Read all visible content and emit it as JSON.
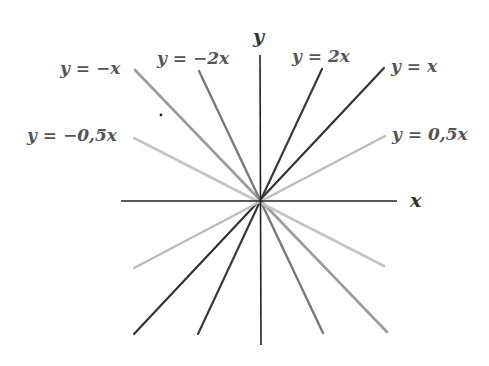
{
  "diagram": {
    "title": "",
    "origin_px": [
      260,
      201
    ],
    "axes": {
      "x_label": "x",
      "y_label": "y",
      "color": "#222222",
      "x_axis_px": [
        [
          121,
          201
        ],
        [
          397,
          201
        ]
      ],
      "y_axis_px": [
        [
          260,
          55
        ],
        [
          261,
          345
        ]
      ]
    },
    "lines": [
      {
        "id": "y_eq_x",
        "label": "y = x",
        "slope": 1,
        "color": "#333333",
        "width": 2.2,
        "p1": [
          134,
          334
        ],
        "p2": [
          384,
          68
        ],
        "label_pos": [
          391,
          72
        ]
      },
      {
        "id": "y_eq_2x",
        "label": "y = 2x",
        "slope": 2,
        "color": "#3a3a3a",
        "width": 2.2,
        "p1": [
          198,
          334
        ],
        "p2": [
          322,
          69
        ],
        "label_pos": [
          292,
          62
        ]
      },
      {
        "id": "y_eq_0_5x",
        "label": "y = 0,5x",
        "slope": 0.5,
        "color": "#bdbdbd",
        "width": 2.4,
        "p1": [
          134,
          268
        ],
        "p2": [
          385,
          136
        ],
        "label_pos": [
          392,
          140
        ]
      },
      {
        "id": "y_eq_neg_x",
        "label": "y = −x",
        "slope": -1,
        "color": "#9c9c9c",
        "width": 2.6,
        "p1": [
          135,
          70
        ],
        "p2": [
          387,
          332
        ],
        "label_pos": [
          60,
          74
        ]
      },
      {
        "id": "y_eq_neg_2x",
        "label": "y = −2x",
        "slope": -2,
        "color": "#7a7a7a",
        "width": 2.4,
        "p1": [
          199,
          71
        ],
        "p2": [
          323,
          333
        ],
        "label_pos": [
          157,
          64
        ]
      },
      {
        "id": "y_eq_neg_0_5x",
        "label": "y = −0,5x",
        "slope": -0.5,
        "color": "#c4c4c4",
        "width": 2.6,
        "p1": [
          134,
          138
        ],
        "p2": [
          384,
          266
        ],
        "label_pos": [
          27,
          141
        ]
      }
    ],
    "stray_dot_px": [
      161,
      115
    ]
  }
}
